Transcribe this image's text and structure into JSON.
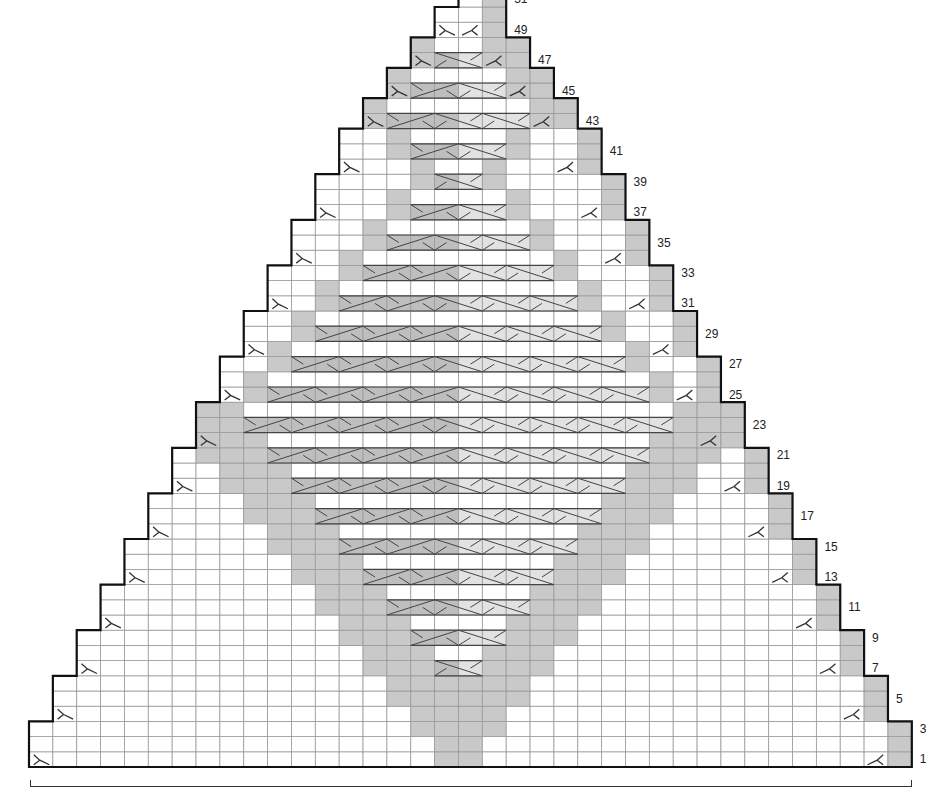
{
  "chart_title": "",
  "grid": {
    "columns": 37,
    "rows_visible": 51,
    "origin_x": 29,
    "bottom_y": 767,
    "cell_w": 23.86,
    "cell_h": 15.2
  },
  "colors": {
    "grid_line": "#9a9a9a",
    "outline": "#111111",
    "shade": "#c9c9c9",
    "cable_left": "#bebebe",
    "cable_right": "#e2e2e2",
    "cable_line": "#444444",
    "mark": "#333333"
  },
  "row_labels": [
    {
      "row": 1,
      "text": "1"
    },
    {
      "row": 3,
      "text": "3"
    },
    {
      "row": 5,
      "text": "5"
    },
    {
      "row": 7,
      "text": "7"
    },
    {
      "row": 9,
      "text": "9"
    },
    {
      "row": 11,
      "text": "11"
    },
    {
      "row": 13,
      "text": "13"
    },
    {
      "row": 15,
      "text": "15"
    },
    {
      "row": 17,
      "text": "17"
    },
    {
      "row": 19,
      "text": "19"
    },
    {
      "row": 21,
      "text": "21"
    },
    {
      "row": 23,
      "text": "23"
    },
    {
      "row": 25,
      "text": "25"
    },
    {
      "row": 27,
      "text": "27"
    },
    {
      "row": 29,
      "text": "29"
    },
    {
      "row": 31,
      "text": "31"
    },
    {
      "row": 33,
      "text": "33"
    },
    {
      "row": 35,
      "text": "35"
    },
    {
      "row": 37,
      "text": "37"
    },
    {
      "row": 39,
      "text": "39"
    },
    {
      "row": 41,
      "text": "41"
    },
    {
      "row": 43,
      "text": "43"
    },
    {
      "row": 45,
      "text": "45"
    },
    {
      "row": 47,
      "text": "47"
    },
    {
      "row": 49,
      "text": "49"
    },
    {
      "row": 51,
      "text": "51"
    }
  ],
  "shaping": {
    "description": "Triangle; both edges decrease 1 stitch every 3 rows to row 42, then every 2 rows",
    "step_k": [
      0,
      0,
      0,
      1,
      1,
      1,
      2,
      2,
      2,
      3,
      3,
      3,
      4,
      4,
      4,
      5,
      5,
      5,
      6,
      6,
      6,
      7,
      7,
      7,
      8,
      8,
      8,
      9,
      9,
      9,
      10,
      10,
      10,
      11,
      11,
      11,
      12,
      12,
      12,
      13,
      13,
      13,
      14,
      14,
      15,
      15,
      16,
      16,
      17,
      17,
      18
    ],
    "right_override": {
      "51": 19
    }
  },
  "cable_rows": [
    {
      "row": 7,
      "from": 17,
      "to": 18
    },
    {
      "row": 9,
      "from": 16,
      "to": 19
    },
    {
      "row": 11,
      "from": 15,
      "to": 20
    },
    {
      "row": 13,
      "from": 14,
      "to": 21
    },
    {
      "row": 15,
      "from": 13,
      "to": 22
    },
    {
      "row": 17,
      "from": 12,
      "to": 23
    },
    {
      "row": 19,
      "from": 11,
      "to": 24
    },
    {
      "row": 21,
      "from": 10,
      "to": 25
    },
    {
      "row": 23,
      "from": 9,
      "to": 26
    },
    {
      "row": 25,
      "from": 10,
      "to": 25
    },
    {
      "row": 27,
      "from": 11,
      "to": 24
    },
    {
      "row": 29,
      "from": 12,
      "to": 23
    },
    {
      "row": 31,
      "from": 13,
      "to": 22
    },
    {
      "row": 33,
      "from": 14,
      "to": 21
    },
    {
      "row": 35,
      "from": 15,
      "to": 20
    },
    {
      "row": 37,
      "from": 16,
      "to": 19
    },
    {
      "row": 39,
      "from": 17,
      "to": 18
    },
    {
      "row": 41,
      "from": 16,
      "to": 19
    },
    {
      "row": 43,
      "from": 15,
      "to": 20
    },
    {
      "row": 45,
      "from": 16,
      "to": 19
    },
    {
      "row": 47,
      "from": 17,
      "to": 18
    }
  ],
  "diamond": {
    "lower_last_row": 24,
    "center": 17.5,
    "upper_outline_rows": [
      25,
      42
    ]
  },
  "legend": {
    "shaded": "contrast colour stitch",
    "cable": "cable cross",
    "decrease_left": "decrease (left edge)",
    "decrease_right": "decrease (right edge)"
  }
}
